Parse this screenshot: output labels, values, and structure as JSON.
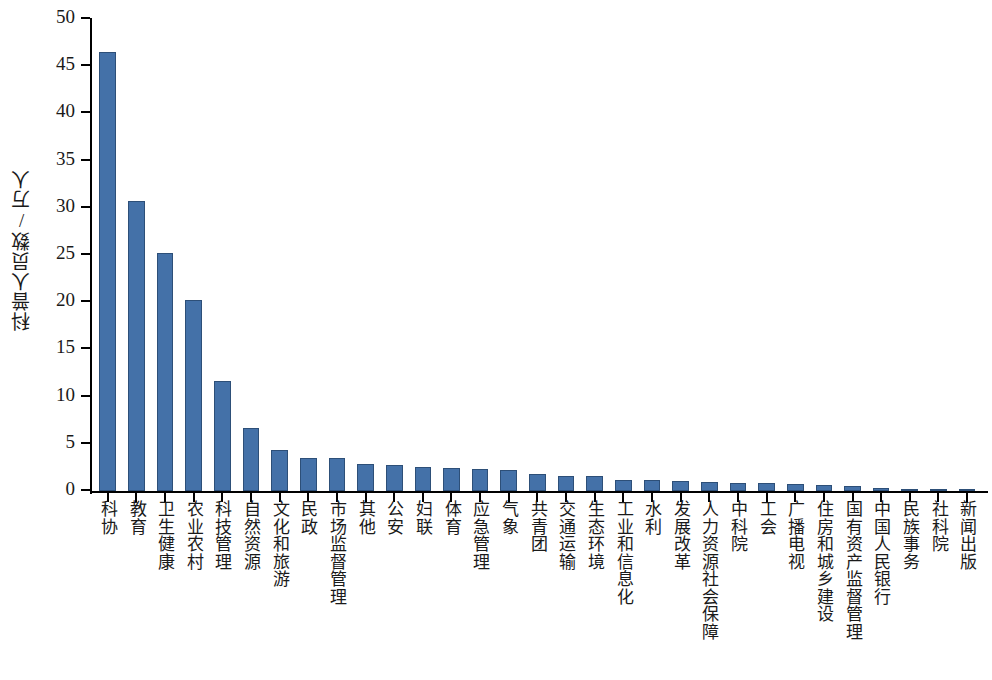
{
  "chart_data": {
    "type": "bar",
    "title": "",
    "xlabel": "",
    "ylabel": "科普人员数/万人",
    "ylim": [
      0,
      50
    ],
    "yticks": [
      0,
      5,
      10,
      15,
      20,
      25,
      30,
      35,
      40,
      45,
      50
    ],
    "grid": false,
    "legend": null,
    "bar_color": "#4471a8",
    "bar_edge_color": "#2d4f78",
    "axis_color": "#000000",
    "categories": [
      "科协",
      "教育",
      "卫生健康",
      "农业农村",
      "科技管理",
      "自然资源",
      "文化和旅游",
      "民政",
      "市场监督管理",
      "其他",
      "公安",
      "妇联",
      "体育",
      "应急管理",
      "气象",
      "共青团",
      "交通运输",
      "生态环境",
      "工业和信息化",
      "水利",
      "发展改革",
      "人力资源社会保障",
      "中科院",
      "工会",
      "广播电视",
      "住房和城乡建设",
      "国有资产监督管理",
      "中国人民银行",
      "民族事务",
      "社科院",
      "新闻出版"
    ],
    "values": [
      46.5,
      30.7,
      25.2,
      20.2,
      11.7,
      6.7,
      4.3,
      3.5,
      3.5,
      2.9,
      2.75,
      2.55,
      2.45,
      2.3,
      2.25,
      1.85,
      1.6,
      1.55,
      1.2,
      1.15,
      1.05,
      1.0,
      0.85,
      0.8,
      0.75,
      0.6,
      0.55,
      0.35,
      0.18,
      0.1,
      0.05
    ]
  }
}
